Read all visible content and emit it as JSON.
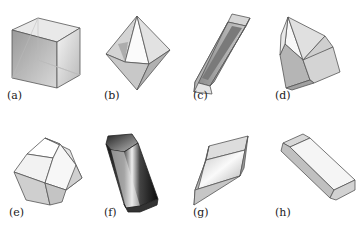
{
  "figure": {
    "panels": [
      {
        "id": "a",
        "label": "(a)",
        "shape": "cube"
      },
      {
        "id": "b",
        "label": "(b)",
        "shape": "octahedron"
      },
      {
        "id": "c",
        "label": "(c)",
        "shape": "elongated-prism"
      },
      {
        "id": "d",
        "label": "(d)",
        "shape": "pyramidal-prism"
      },
      {
        "id": "e",
        "label": "(e)",
        "shape": "dodecahedron"
      },
      {
        "id": "f",
        "label": "(f)",
        "shape": "dark-hexagonal-prism"
      },
      {
        "id": "g",
        "label": "(g)",
        "shape": "rhombohedron"
      },
      {
        "id": "h",
        "label": "(h)",
        "shape": "tabular-prism"
      }
    ]
  }
}
